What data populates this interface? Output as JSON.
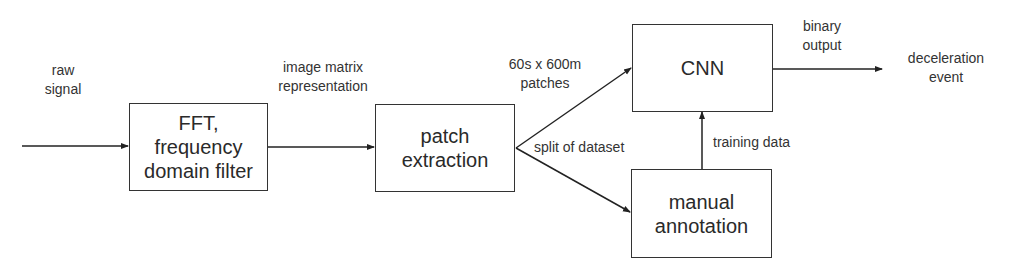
{
  "diagram": {
    "type": "flowchart",
    "nodes": {
      "fft": {
        "label_line1": "FFT,",
        "label_line2": "frequency",
        "label_line3": "domain filter"
      },
      "patch": {
        "label_line1": "patch",
        "label_line2": "extraction"
      },
      "cnn": {
        "label": "CNN"
      },
      "manual": {
        "label_line1": "manual",
        "label_line2": "annotation"
      }
    },
    "edge_labels": {
      "input": {
        "line1": "raw",
        "line2": "signal"
      },
      "fft_to_patch": {
        "line1": "image matrix",
        "line2": "representation"
      },
      "patch_to_cnn": {
        "line1": "60s x 600m",
        "line2": "patches"
      },
      "split": "split of dataset",
      "manual_to_cnn": "training data",
      "cnn_output": {
        "line1": "binary",
        "line2": "output"
      },
      "result": {
        "line1": "deceleration",
        "line2": "event"
      }
    },
    "edges": [
      {
        "from": "raw signal",
        "to": "fft"
      },
      {
        "from": "fft",
        "to": "patch",
        "label": "image matrix representation"
      },
      {
        "from": "patch",
        "to": "cnn",
        "label": "60s x 600m patches"
      },
      {
        "from": "patch",
        "to": "manual",
        "label": "split of dataset"
      },
      {
        "from": "manual",
        "to": "cnn",
        "label": "training data"
      },
      {
        "from": "cnn",
        "to": "deceleration event",
        "label": "binary output"
      }
    ],
    "colors": {
      "stroke": "#333333",
      "text": "#2a2a2a",
      "background": "#ffffff"
    }
  }
}
